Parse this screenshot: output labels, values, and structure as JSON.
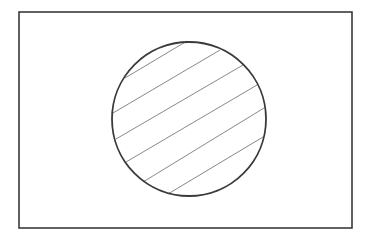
{
  "diagram": {
    "type": "venn-single-set",
    "colors": {
      "background": "#ffffff",
      "outline": "#3a3a3a",
      "hatch": "#7a7a7a"
    },
    "universe_rect": {
      "x": 19,
      "y": 12,
      "width": 333,
      "height": 216
    },
    "circle": {
      "cx": 189,
      "cy": 119,
      "r": 77
    },
    "hatch_lines": [
      {
        "x1": 125,
        "y1": 78,
        "x2": 187,
        "y2": 41
      },
      {
        "x1": 113,
        "y1": 113,
        "x2": 220,
        "y2": 50
      },
      {
        "x1": 116,
        "y1": 139,
        "x2": 243,
        "y2": 65
      },
      {
        "x1": 126,
        "y1": 162,
        "x2": 257,
        "y2": 85
      },
      {
        "x1": 143,
        "y1": 182,
        "x2": 264,
        "y2": 108
      },
      {
        "x1": 168,
        "y1": 194,
        "x2": 263,
        "y2": 137
      }
    ]
  }
}
